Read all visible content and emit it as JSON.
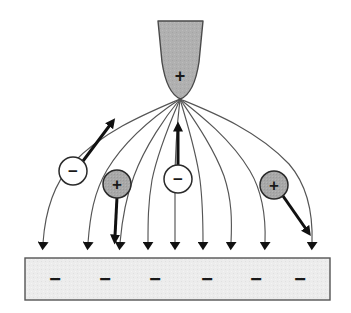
{
  "figure": {
    "background_color": "#ffffff"
  },
  "tip": {
    "label": "+",
    "fill_color": "#b0b0b0",
    "stroke_color": "#4a4a4a",
    "charge": "positive",
    "apex_x": 180,
    "apex_y": 99
  },
  "plate": {
    "fill_color": "#ececec",
    "stroke_color": "#555555",
    "charge": "negative",
    "charge_label": "−",
    "charge_count": 6,
    "charge_labels": [
      "−",
      "−",
      "−",
      "−",
      "−",
      "−"
    ],
    "x": 25,
    "y": 258,
    "width": 305,
    "height": 42
  },
  "field": {
    "line_color": "#555555",
    "line_count": 9,
    "arrow_color": "#111111",
    "landing_x": [
      43,
      88,
      120,
      148,
      175,
      203,
      231,
      265,
      312
    ]
  },
  "particles": [
    {
      "name": "negative-ion-left",
      "label": "−",
      "charge": "negative",
      "fill_color": "#ffffff",
      "stroke_color": "#2a2a2a",
      "cx": 73,
      "cy": 171,
      "r": 14,
      "force_direction": "up-right",
      "force_dx": 33,
      "force_dy": -45
    },
    {
      "name": "positive-ion-left",
      "label": "+",
      "charge": "positive",
      "fill_color": "#a8a8a8",
      "stroke_color": "#2a2a2a",
      "cx": 117,
      "cy": 184,
      "r": 14,
      "force_direction": "down",
      "force_dx": -2,
      "force_dy": 52
    },
    {
      "name": "negative-ion-center",
      "label": "−",
      "charge": "negative",
      "fill_color": "#ffffff",
      "stroke_color": "#2a2a2a",
      "cx": 178,
      "cy": 179,
      "r": 14,
      "force_direction": "up",
      "force_dx": 0,
      "force_dy": -47
    },
    {
      "name": "positive-ion-right",
      "label": "+",
      "charge": "positive",
      "fill_color": "#a8a8a8",
      "stroke_color": "#2a2a2a",
      "cx": 274,
      "cy": 185,
      "r": 14,
      "force_direction": "down-right",
      "force_dx": 31,
      "force_dy": 48
    }
  ]
}
